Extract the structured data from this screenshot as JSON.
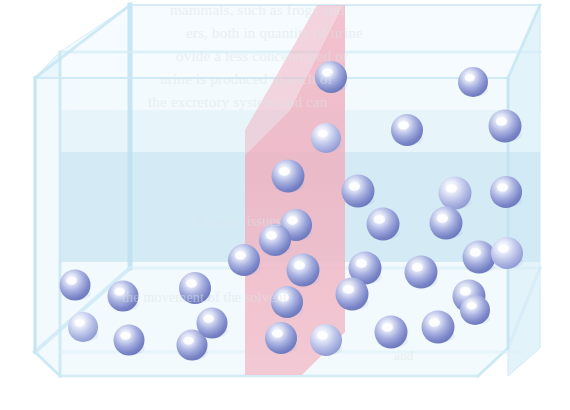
{
  "figure": {
    "container_shape": "transparent-cube",
    "membrane_label": "semipermeable-membrane",
    "colors": {
      "cube_fill": "#eaf5fb",
      "cube_face_front": "#f3fafd",
      "cube_face_top": "#f7fcfe",
      "cube_edge": "#bfe0f0",
      "cube_back_wall": "#cfe8f4",
      "membrane_pink": "#f0b7c4",
      "membrane_pink_light": "#f4cbd6",
      "sphere_rim": "#6f7cc0",
      "sphere_mid": "#8f9ad6",
      "sphere_core": "#d6dcf2",
      "sphere_highlight": "#ffffff",
      "background": "#ffffff",
      "ghost_text": "#dfe4ea"
    },
    "geometry": {
      "canvas_width": 570,
      "canvas_height": 410,
      "front_face": [
        [
          35,
          78
        ],
        [
          35,
          352
        ],
        [
          60,
          376
        ],
        [
          478,
          376
        ],
        [
          508,
          348
        ],
        [
          508,
          78
        ]
      ],
      "top_face_back_edge_y": 5,
      "back_wall_band": [
        150,
        262
      ],
      "membrane_polygon": [
        [
          345,
          0
        ],
        [
          345,
          330
        ],
        [
          300,
          375
        ],
        [
          245,
          375
        ],
        [
          245,
          155
        ],
        [
          290,
          112
        ]
      ]
    },
    "counts": {
      "left_compartment_spheres": 7,
      "right_compartment_spheres": 27,
      "total_spheres": 34
    }
  },
  "spheres": {
    "left": [
      {
        "cx": 75,
        "cy": 285,
        "r": 15.5
      },
      {
        "cx": 83,
        "cy": 327,
        "r": 15.0
      },
      {
        "cx": 123,
        "cy": 296,
        "r": 15.5
      },
      {
        "cx": 129,
        "cy": 340,
        "r": 15.5
      },
      {
        "cx": 192,
        "cy": 345,
        "r": 15.5
      },
      {
        "cx": 195,
        "cy": 288,
        "r": 16.0
      },
      {
        "cx": 212,
        "cy": 323,
        "r": 15.5
      }
    ],
    "right": [
      {
        "cx": 331,
        "cy": 77,
        "r": 16.0
      },
      {
        "cx": 326,
        "cy": 138,
        "r": 15.0
      },
      {
        "cx": 407,
        "cy": 130,
        "r": 16.0
      },
      {
        "cx": 473,
        "cy": 82,
        "r": 15.0
      },
      {
        "cx": 505,
        "cy": 126,
        "r": 16.5
      },
      {
        "cx": 288,
        "cy": 176,
        "r": 16.5
      },
      {
        "cx": 296,
        "cy": 225,
        "r": 16.0
      },
      {
        "cx": 358,
        "cy": 191,
        "r": 16.5
      },
      {
        "cx": 455,
        "cy": 193,
        "r": 16.5
      },
      {
        "cx": 506,
        "cy": 192,
        "r": 16.0
      },
      {
        "cx": 275,
        "cy": 240,
        "r": 16.0
      },
      {
        "cx": 303,
        "cy": 270,
        "r": 16.5
      },
      {
        "cx": 383,
        "cy": 224,
        "r": 16.5
      },
      {
        "cx": 446,
        "cy": 223,
        "r": 16.5
      },
      {
        "cx": 479,
        "cy": 257,
        "r": 16.5
      },
      {
        "cx": 507,
        "cy": 253,
        "r": 16.0
      },
      {
        "cx": 287,
        "cy": 302,
        "r": 16.0
      },
      {
        "cx": 365,
        "cy": 268,
        "r": 16.5
      },
      {
        "cx": 421,
        "cy": 272,
        "r": 16.5
      },
      {
        "cx": 469,
        "cy": 296,
        "r": 16.5
      },
      {
        "cx": 352,
        "cy": 294,
        "r": 16.5
      },
      {
        "cx": 281,
        "cy": 338,
        "r": 16.0
      },
      {
        "cx": 326,
        "cy": 340,
        "r": 16.0
      },
      {
        "cx": 391,
        "cy": 332,
        "r": 16.5
      },
      {
        "cx": 438,
        "cy": 327,
        "r": 16.5
      },
      {
        "cx": 475,
        "cy": 310,
        "r": 15.0
      },
      {
        "cx": 244,
        "cy": 260,
        "r": 16.0
      }
    ]
  },
  "ghost_text": {
    "note": "faint show-through text from the reverse side of the printed page",
    "lines": [
      {
        "text": "mammals, such as frogs and",
        "x": 170,
        "y": 2,
        "size": 15
      },
      {
        "text": "ers, both in quantity of urine",
        "x": 186,
        "y": 25,
        "size": 15
      },
      {
        "text": "ovide a less concentrated or",
        "x": 176,
        "y": 48,
        "size": 15
      },
      {
        "text": "urine is produced in each of",
        "x": 160,
        "y": 71,
        "size": 15
      },
      {
        "text": "the excretory system and can",
        "x": 148,
        "y": 94,
        "size": 15
      },
      {
        "text": "in most tissues",
        "x": 196,
        "y": 214,
        "size": 14
      },
      {
        "text": "the movement of the solvent",
        "x": 122,
        "y": 290,
        "size": 14
      },
      {
        "text": "and",
        "x": 394,
        "y": 348,
        "size": 13
      }
    ]
  }
}
